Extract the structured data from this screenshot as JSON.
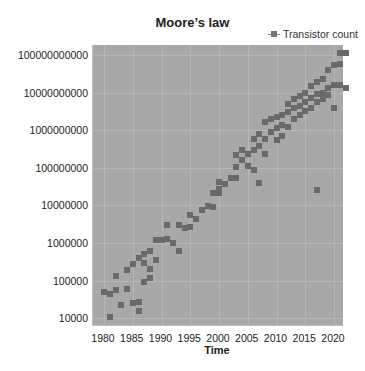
{
  "chart_data": {
    "type": "scatter",
    "title": "Moore’s law",
    "xlabel": "Time",
    "ylabel": "log(transistor count)",
    "legend": [
      "Transistor count"
    ],
    "legend_position": "top-right",
    "y_scale": "log",
    "xlim": [
      1978,
      2023
    ],
    "ylim": [
      7000,
      200000000000
    ],
    "x_ticks": [
      1980,
      1985,
      1990,
      1995,
      2000,
      2005,
      2010,
      2015,
      2020
    ],
    "y_ticks": [
      "100000000000",
      "10000000000",
      "1000000000",
      "100000000",
      "10000000",
      "1000000",
      "100000",
      "10000"
    ],
    "grid": true,
    "series": [
      {
        "name": "Transistor count",
        "points": [
          [
            1980,
            50000
          ],
          [
            1981,
            45000
          ],
          [
            1981,
            11000
          ],
          [
            1982,
            55000
          ],
          [
            1982,
            130000
          ],
          [
            1983,
            22000
          ],
          [
            1984,
            58000
          ],
          [
            1984,
            190000
          ],
          [
            1985,
            25000
          ],
          [
            1985,
            275000
          ],
          [
            1986,
            27000
          ],
          [
            1986,
            16000
          ],
          [
            1986,
            400000
          ],
          [
            1987,
            500000
          ],
          [
            1987,
            290000
          ],
          [
            1987,
            90000
          ],
          [
            1988,
            600000
          ],
          [
            1988,
            200000
          ],
          [
            1988,
            120000
          ],
          [
            1989,
            350000
          ],
          [
            1989,
            1200000
          ],
          [
            1990,
            1200000
          ],
          [
            1991,
            1300000
          ],
          [
            1991,
            3100000
          ],
          [
            1992,
            1000000
          ],
          [
            1993,
            3100000
          ],
          [
            1993,
            600000
          ],
          [
            1994,
            2500000
          ],
          [
            1995,
            5500000
          ],
          [
            1995,
            2700000
          ],
          [
            1996,
            4300000
          ],
          [
            1997,
            7500000
          ],
          [
            1998,
            9500000
          ],
          [
            1999,
            22000000
          ],
          [
            1999,
            9300000
          ],
          [
            2000,
            21000000
          ],
          [
            2000,
            42000000
          ],
          [
            2000,
            28000000
          ],
          [
            2001,
            37000000
          ],
          [
            2002,
            55000000
          ],
          [
            2003,
            105000000
          ],
          [
            2003,
            220000000
          ],
          [
            2003,
            54000000
          ],
          [
            2004,
            160000000
          ],
          [
            2004,
            300000000
          ],
          [
            2005,
            230000000
          ],
          [
            2005,
            110000000
          ],
          [
            2006,
            590000000
          ],
          [
            2006,
            290000000
          ],
          [
            2006,
            90000000
          ],
          [
            2007,
            800000000
          ],
          [
            2007,
            390000000
          ],
          [
            2007,
            40000000
          ],
          [
            2008,
            580000000
          ],
          [
            2008,
            1700000000
          ],
          [
            2008,
            230000000
          ],
          [
            2009,
            900000000
          ],
          [
            2009,
            2000000000
          ],
          [
            2010,
            2300000000
          ],
          [
            2010,
            1170000000
          ],
          [
            2010,
            560000000
          ],
          [
            2011,
            2600000000
          ],
          [
            2011,
            1400000000
          ],
          [
            2011,
            700000000
          ],
          [
            2012,
            3100000000
          ],
          [
            2012,
            5000000000
          ],
          [
            2012,
            1200000000
          ],
          [
            2013,
            3900000000
          ],
          [
            2013,
            2000000000
          ],
          [
            2013,
            6800000000
          ],
          [
            2014,
            4300000000
          ],
          [
            2014,
            8000000000
          ],
          [
            2014,
            2600000000
          ],
          [
            2015,
            5500000000
          ],
          [
            2015,
            10000000000
          ],
          [
            2015,
            3200000000
          ],
          [
            2016,
            7200000000
          ],
          [
            2016,
            15000000000
          ],
          [
            2016,
            4000000000
          ],
          [
            2017,
            9000000000
          ],
          [
            2017,
            19000000000
          ],
          [
            2017,
            25000000
          ],
          [
            2017,
            5500000000
          ],
          [
            2018,
            6900000000
          ],
          [
            2018,
            23000000000
          ],
          [
            2018,
            10000000000
          ],
          [
            2019,
            8500000000
          ],
          [
            2019,
            39000000000
          ],
          [
            2019,
            13000000000
          ],
          [
            2020,
            54000000000
          ],
          [
            2020,
            16000000000
          ],
          [
            2020,
            3900000000
          ],
          [
            2021,
            114000000000
          ],
          [
            2021,
            16000000000
          ],
          [
            2021,
            57000000000
          ],
          [
            2022,
            13000000000
          ],
          [
            2022,
            114000000000
          ]
        ]
      }
    ]
  }
}
